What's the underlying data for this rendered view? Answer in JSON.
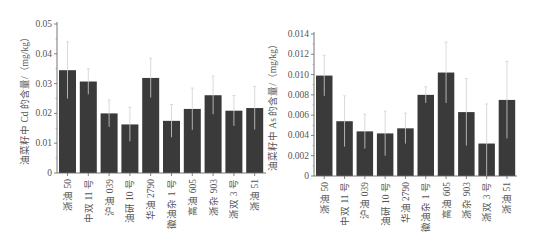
{
  "chart_data": [
    {
      "type": "bar",
      "title": "",
      "xlabel": "",
      "ylabel": "油菜籽中 Cd 的含量/（mg/kg）",
      "ylim": [
        0,
        0.05
      ],
      "yticks": [
        "0",
        "0.01",
        "0.02",
        "0.03",
        "0.04",
        "0.05"
      ],
      "ytick_values": [
        0,
        0.01,
        0.02,
        0.03,
        0.04,
        0.05
      ],
      "grid": false,
      "legend": null,
      "categories": [
        "浙油 50",
        "中双 11 号",
        "沪油 039",
        "油研 10 号",
        "华油 2790",
        "徽油杂 1 号",
        "高油 605",
        "浙杂 903",
        "浙双 3 号",
        "浙油 51"
      ],
      "values": [
        0.0345,
        0.0307,
        0.02,
        0.0163,
        0.0319,
        0.0175,
        0.0215,
        0.0261,
        0.0209,
        0.0218
      ],
      "error_upper": [
        0.044,
        0.035,
        0.0245,
        0.022,
        0.0385,
        0.023,
        0.0285,
        0.0325,
        0.026,
        0.029
      ],
      "bar_color": "#3a3a3a",
      "error_color": "#d0d0d0"
    },
    {
      "type": "bar",
      "title": "",
      "xlabel": "",
      "ylabel": "油菜籽中 As 的含量/（mg/kg）",
      "ylim": [
        0,
        0.014
      ],
      "yticks": [
        "0",
        "0.002",
        "0.004",
        "0.006",
        "0.008",
        "0.010",
        "0.012",
        "0.014"
      ],
      "ytick_values": [
        0,
        0.002,
        0.004,
        0.006,
        0.008,
        0.01,
        0.012,
        0.014
      ],
      "grid": false,
      "legend": null,
      "categories": [
        "浙油 50",
        "中双 11 号",
        "沪油 039",
        "油研 10 号",
        "华油 2790",
        "徽油杂 1 号",
        "高油 605",
        "浙杂 903",
        "浙双 3 号",
        "浙油 51"
      ],
      "values": [
        0.0099,
        0.0054,
        0.0044,
        0.0042,
        0.0047,
        0.008,
        0.0102,
        0.0063,
        0.0032,
        0.0075
      ],
      "error_upper": [
        0.0119,
        0.0079,
        0.0061,
        0.0064,
        0.0062,
        0.0088,
        0.0132,
        0.0096,
        0.0071,
        0.0113
      ],
      "bar_color": "#3a3a3a",
      "error_color": "#d0d0d0"
    }
  ],
  "layout": [
    {
      "axis_x": 57,
      "y_top": 24,
      "y_bottom": 173,
      "x_end": 266,
      "bar_start": 59,
      "pitch": 20.8,
      "bar_w": 17,
      "ylabel_x": 28
    },
    {
      "axis_x": 314,
      "y_top": 34,
      "y_bottom": 176,
      "x_end": 517,
      "bar_start": 316,
      "pitch": 20.3,
      "bar_w": 16.5,
      "ylabel_x": 276
    }
  ]
}
